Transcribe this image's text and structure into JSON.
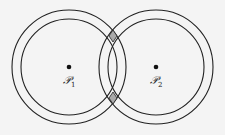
{
  "diagram": {
    "background": "#f4f4f4",
    "stroke": "#222222",
    "intersection_fill": "#aaaaaa",
    "nodes": [
      {
        "id": "P1",
        "label": "ℬ",
        "script": "P",
        "subscript": "1",
        "cx": 69,
        "cy": 67
      },
      {
        "id": "P2",
        "label": "ℬ",
        "script": "P",
        "subscript": "2",
        "cx": 156,
        "cy": 67
      }
    ],
    "rings": {
      "outer_radius": 57,
      "inner_radius": 48
    },
    "labels": {
      "p1_main": "𝒫",
      "p1_sub": "1",
      "p2_main": "𝒫",
      "p2_sub": "2"
    }
  }
}
